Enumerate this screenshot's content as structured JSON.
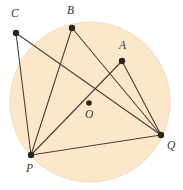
{
  "figure": {
    "type": "circle-geometry-diagram",
    "canvas": {
      "width": 183,
      "height": 190
    },
    "colors": {
      "background": "#ffffff",
      "circle_fill": "#fce7cb",
      "circle_stroke": "#f3dcbd",
      "line": "#4a4038",
      "point": "#2b2420",
      "label": "#3b332c"
    },
    "circle": {
      "cx": 90,
      "cy": 102,
      "r": 80
    },
    "points": [
      {
        "id": "C",
        "label": "C",
        "x": 16,
        "y": 33,
        "label_x": 11,
        "label_y": 17,
        "on_circle": true
      },
      {
        "id": "B",
        "label": "B",
        "x": 72,
        "y": 28,
        "label_x": 67,
        "label_y": 14,
        "on_circle": true
      },
      {
        "id": "A",
        "label": "A",
        "x": 122,
        "y": 61,
        "label_x": 119,
        "label_y": 49,
        "on_circle": true
      },
      {
        "id": "Q",
        "label": "Q",
        "x": 161,
        "y": 135,
        "label_x": 167,
        "label_y": 149,
        "on_circle": true
      },
      {
        "id": "P",
        "label": "P",
        "x": 31,
        "y": 155,
        "label_x": 26,
        "label_y": 172,
        "on_circle": true
      },
      {
        "id": "O",
        "label": "O",
        "x": 89,
        "y": 103,
        "label_x": 85,
        "label_y": 118,
        "on_circle": false
      }
    ],
    "segments": [
      {
        "id": "CP",
        "from": "C",
        "to": "P"
      },
      {
        "id": "CQ",
        "from": "C",
        "to": "Q"
      },
      {
        "id": "BP",
        "from": "B",
        "to": "P"
      },
      {
        "id": "BQ",
        "from": "B",
        "to": "Q"
      },
      {
        "id": "AP",
        "from": "A",
        "to": "P"
      },
      {
        "id": "AQ",
        "from": "A",
        "to": "Q"
      },
      {
        "id": "PQ",
        "from": "P",
        "to": "Q"
      }
    ],
    "point_radius": 3.2,
    "center_point_radius": 2.8,
    "line_width": 1.1
  }
}
